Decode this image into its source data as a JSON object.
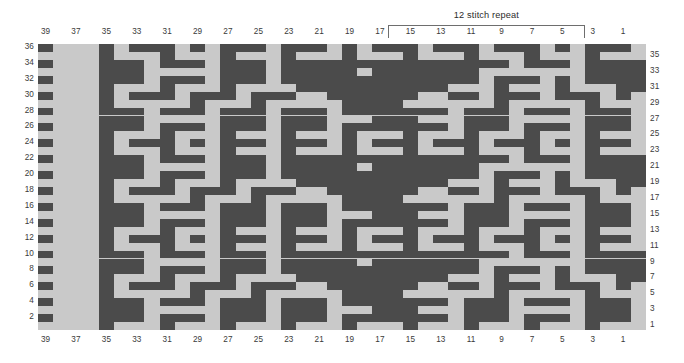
{
  "chart_data": {
    "type": "heatmap",
    "title": "",
    "annotation": "12 stitch repeat",
    "columns": 40,
    "rows": 36,
    "xlabel": "",
    "ylabel": "",
    "grid": true,
    "legend": "none",
    "colors": {
      "filled": "#4b4b4b",
      "empty": "#c9c9c9",
      "text": "#3a3a3a",
      "bracket": "#6e6e6e"
    },
    "column_labels_top": [
      "39",
      "",
      "37",
      "",
      "35",
      "",
      "33",
      "",
      "31",
      "",
      "29",
      "",
      "27",
      "",
      "25",
      "",
      "23",
      "",
      "21",
      "",
      "19",
      "",
      "17",
      "",
      "15",
      "",
      "13",
      "",
      "11",
      "",
      "9",
      "",
      "7",
      "",
      "5",
      "",
      "3",
      "",
      "1",
      ""
    ],
    "column_labels_bottom": [
      "39",
      "",
      "37",
      "",
      "35",
      "",
      "33",
      "",
      "31",
      "",
      "29",
      "",
      "27",
      "",
      "25",
      "",
      "23",
      "",
      "21",
      "",
      "19",
      "",
      "17",
      "",
      "15",
      "",
      "13",
      "",
      "11",
      "",
      "9",
      "",
      "7",
      "",
      "5",
      "",
      "3",
      "",
      "1",
      ""
    ],
    "row_labels_left": [
      "36",
      "",
      "34",
      "",
      "32",
      "",
      "30",
      "",
      "28",
      "",
      "26",
      "",
      "24",
      "",
      "22",
      "",
      "20",
      "",
      "18",
      "",
      "16",
      "",
      "14",
      "",
      "12",
      "",
      "10",
      "",
      "8",
      "",
      "6",
      "",
      "4",
      "",
      "2",
      ""
    ],
    "row_labels_right": [
      "",
      "35",
      "",
      "33",
      "",
      "31",
      "",
      "29",
      "",
      "27",
      "",
      "25",
      "",
      "23",
      "",
      "21",
      "",
      "19",
      "",
      "17",
      "",
      "15",
      "",
      "13",
      "",
      "11",
      "",
      "9",
      "",
      "7",
      "",
      "5",
      "",
      "3",
      "",
      "1"
    ],
    "repeat": {
      "label": "12 stitch repeat",
      "from_column": 17,
      "to_column": 5,
      "stitches": 12
    },
    "cells": [
      "1000101110101110111010111011101110101110",
      "0000100010001000100010001000100010001000",
      "1000111011101110111111111111111011101111",
      "0000111000001110111110111111100000001111",
      "1000111011101110111111111111101110101111",
      "0000100010001000011111111110001000100011",
      "1000101110111011100111111001101110111010",
      "0000100000100010000011110000001000001000",
      "1000111011101110111011111110111011101110",
      "0000111000001110111000111000111000001110",
      "1000111011101110111011111110111011101110",
      "0000100010001000100010001000100010001000",
      "1000101110101110111010111011101110101110",
      "0000100010001000100010001000100010001000",
      "1000111011101110111111111111111011101111",
      "0000111000001110111110111111100000001111",
      "1000111011101110111111111111101110101111",
      "0000100010001000011111111110001000100011",
      "1000101110111011100111111001101110111010",
      "0000100000100010000011110000001000001000",
      "1000111011101110111011111110111011101110",
      "0000111000001110111000111000111000001110",
      "1000111011101110111011111110111011101110",
      "0000100010001000100010001000100010001000",
      "1000101110101110111010111011101110101110",
      "0000100010001000100010001000100010001000",
      "1000111011101110111111111111111011101111",
      "0000111000001110111110111111100000001111",
      "1000111011101110111111111111101110101111",
      "0000100010001000011111111110001000100011",
      "1000101110111011100111111001101110111010",
      "0000100000100010000011110000001000001000",
      "1000111011101110111011111110111011101110",
      "0000111000001110111000111000111000001110",
      "1000111011101110111011111110111011101110",
      "0000100010001000100010001000100010001000"
    ]
  }
}
